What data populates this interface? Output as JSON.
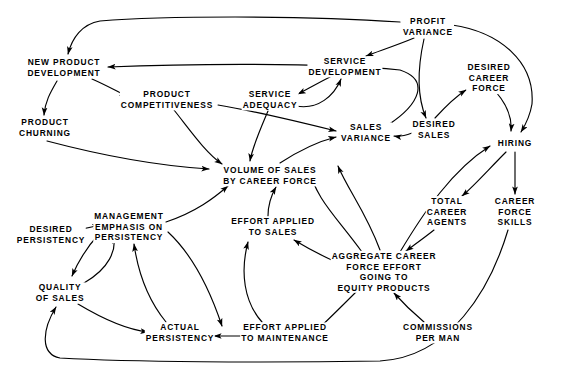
{
  "diagram": {
    "type": "causal-loop-diagram",
    "width": 562,
    "height": 390,
    "background_color": "#ffffff",
    "line_color": "#000000",
    "text_color": "#000000"
  },
  "nodes": [
    {
      "id": "new_product_development",
      "label": "NEW PRODUCT\nDEVELOPMENT",
      "x": 64,
      "y": 68
    },
    {
      "id": "product_churning",
      "label": "PRODUCT\nCHURNING",
      "x": 45,
      "y": 128
    },
    {
      "id": "product_competitiveness",
      "label": "PRODUCT\nCOMPETITIVENESS",
      "x": 167,
      "y": 100
    },
    {
      "id": "service_adequacy",
      "label": "SERVICE\nADEQUACY",
      "x": 270,
      "y": 100
    },
    {
      "id": "service_development",
      "label": "SERVICE\nDEVELOPMENT",
      "x": 345,
      "y": 67
    },
    {
      "id": "profit_variance",
      "label": "PROFIT\nVARIANCE",
      "x": 428,
      "y": 27
    },
    {
      "id": "desired_career_force",
      "label": "DESIRED\nCAREER\nFORCE",
      "x": 489,
      "y": 78
    },
    {
      "id": "sales_variance",
      "label": "SALES\nVARIANCE",
      "x": 366,
      "y": 133
    },
    {
      "id": "desired_sales",
      "label": "DESIRED\nSALES",
      "x": 434,
      "y": 130
    },
    {
      "id": "hiring",
      "label": "HIRING",
      "x": 515,
      "y": 143
    },
    {
      "id": "volume_of_sales",
      "label": "VOLUME OF SALES\nBY CAREER FORCE",
      "x": 270,
      "y": 176
    },
    {
      "id": "total_career_agents",
      "label": "TOTAL\nCAREER\nAGENTS",
      "x": 447,
      "y": 212
    },
    {
      "id": "career_force_skills",
      "label": "CAREER\nFORCE\nSKILLS",
      "x": 515,
      "y": 212
    },
    {
      "id": "management_emphasis",
      "label": "MANAGEMENT\nEMPHASIS ON\nPERSISTENCY",
      "x": 129,
      "y": 227
    },
    {
      "id": "desired_persistency",
      "label": "DESIRED\nPERSISTENCY",
      "x": 51,
      "y": 235
    },
    {
      "id": "effort_applied_to_sales",
      "label": "EFFORT APPLIED\nTO SALES",
      "x": 273,
      "y": 227
    },
    {
      "id": "aggregate_career_force_effort",
      "label": "AGGREGATE CAREER\nFORCE EFFORT\nGOING TO\nEQUITY PRODUCTS",
      "x": 384,
      "y": 272
    },
    {
      "id": "quality_of_sales",
      "label": "QUALITY\nOF SALES",
      "x": 60,
      "y": 293
    },
    {
      "id": "actual_persistency",
      "label": "ACTUAL\nPERSISTENCY",
      "x": 180,
      "y": 333
    },
    {
      "id": "effort_applied_to_maintenance",
      "label": "EFFORT APPLIED\nTO MAINTENANCE",
      "x": 285,
      "y": 333
    },
    {
      "id": "commissions_per_man",
      "label": "COMMISSIONS\nPER MAN",
      "x": 438,
      "y": 333
    }
  ],
  "edges": [
    {
      "from": "profit_variance",
      "to": "new_product_development"
    },
    {
      "from": "profit_variance",
      "to": "service_development"
    },
    {
      "from": "profit_variance",
      "to": "desired_sales"
    },
    {
      "from": "profit_variance",
      "to": "hiring"
    },
    {
      "from": "new_product_development",
      "to": "product_churning"
    },
    {
      "from": "new_product_development",
      "to": "product_competitiveness"
    },
    {
      "from": "product_churning",
      "to": "volume_of_sales"
    },
    {
      "from": "product_competitiveness",
      "to": "volume_of_sales"
    },
    {
      "from": "product_competitiveness",
      "to": "sales_variance"
    },
    {
      "from": "service_adequacy",
      "to": "volume_of_sales"
    },
    {
      "from": "service_adequacy",
      "to": "service_development"
    },
    {
      "from": "service_development",
      "to": "service_adequacy"
    },
    {
      "from": "sales_variance",
      "to": "new_product_development"
    },
    {
      "from": "desired_sales",
      "to": "sales_variance"
    },
    {
      "from": "desired_sales",
      "to": "desired_career_force"
    },
    {
      "from": "desired_career_force",
      "to": "hiring"
    },
    {
      "from": "volume_of_sales",
      "to": "sales_variance"
    },
    {
      "from": "hiring",
      "to": "total_career_agents"
    },
    {
      "from": "hiring",
      "to": "career_force_skills"
    },
    {
      "from": "total_career_agents",
      "to": "aggregate_career_force_effort"
    },
    {
      "from": "career_force_skills",
      "to": "quality_of_sales"
    },
    {
      "from": "aggregate_career_force_effort",
      "to": "effort_applied_to_sales"
    },
    {
      "from": "aggregate_career_force_effort",
      "to": "effort_applied_to_maintenance"
    },
    {
      "from": "aggregate_career_force_effort",
      "to": "volume_of_sales"
    },
    {
      "from": "aggregate_career_force_effort",
      "to": "hiring"
    },
    {
      "from": "commissions_per_man",
      "to": "aggregate_career_force_effort"
    },
    {
      "from": "effort_applied_to_sales",
      "to": "volume_of_sales"
    },
    {
      "from": "effort_applied_to_maintenance",
      "to": "actual_persistency"
    },
    {
      "from": "effort_applied_to_maintenance",
      "to": "effort_applied_to_sales"
    },
    {
      "from": "management_emphasis",
      "to": "volume_of_sales"
    },
    {
      "from": "management_emphasis",
      "to": "quality_of_sales"
    },
    {
      "from": "management_emphasis",
      "to": "effort_applied_to_maintenance"
    },
    {
      "from": "desired_persistency",
      "to": "management_emphasis"
    },
    {
      "from": "quality_of_sales",
      "to": "management_emphasis"
    },
    {
      "from": "quality_of_sales",
      "to": "actual_persistency"
    },
    {
      "from": "actual_persistency",
      "to": "management_emphasis"
    }
  ]
}
